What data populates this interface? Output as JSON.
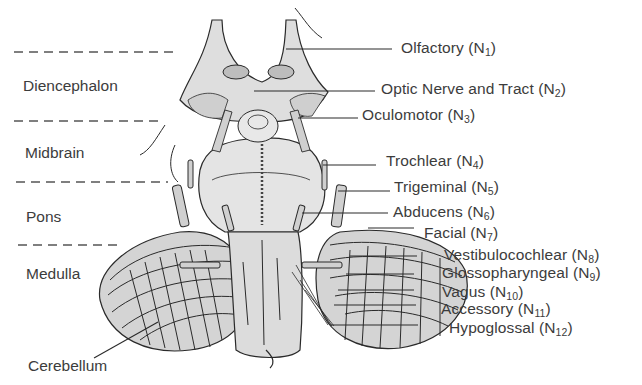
{
  "figure": {
    "regions": [
      {
        "id": "diencephalon",
        "label": "Diencephalon"
      },
      {
        "id": "midbrain",
        "label": "Midbrain"
      },
      {
        "id": "pons",
        "label": "Pons"
      },
      {
        "id": "medulla",
        "label": "Medulla"
      },
      {
        "id": "cerebellum",
        "label": "Cerebellum"
      }
    ],
    "nerves": [
      {
        "id": "olfactory",
        "name": "Olfactory",
        "prefix": " (N",
        "num": "1",
        "suffix": ")"
      },
      {
        "id": "optic",
        "name": "Optic Nerve and Tract",
        "prefix": " (N",
        "num": "2",
        "suffix": ")"
      },
      {
        "id": "oculomotor",
        "name": "Oculomotor",
        "prefix": " (N",
        "num": "3",
        "suffix": ")"
      },
      {
        "id": "trochlear",
        "name": "Trochlear",
        "prefix": " (N",
        "num": "4",
        "suffix": ")"
      },
      {
        "id": "trigeminal",
        "name": "Trigeminal",
        "prefix": " (N",
        "num": "5",
        "suffix": ")"
      },
      {
        "id": "abducens",
        "name": "Abducens",
        "prefix": " (N",
        "num": "6",
        "suffix": ")"
      },
      {
        "id": "facial",
        "name": "Facial",
        "prefix": " (N",
        "num": "7",
        "suffix": ")"
      },
      {
        "id": "vestibulocochlear",
        "name": "Vestibulocochlear",
        "prefix": " (N",
        "num": "8",
        "suffix": ")"
      },
      {
        "id": "glossopharyngeal",
        "name": "Glossopharyngeal",
        "prefix": " (N",
        "num": "9",
        "suffix": ")"
      },
      {
        "id": "vagus",
        "name": "Vagus",
        "prefix": " (N",
        "num": "10",
        "suffix": ")"
      },
      {
        "id": "accessory",
        "name": "Accessory",
        "prefix": " (N",
        "num": "11",
        "suffix": ")"
      },
      {
        "id": "hypoglossal",
        "name": "Hypoglossal",
        "prefix": " (N",
        "num": "12",
        "suffix": ")"
      }
    ],
    "colors": {
      "ink": "#2a2a2a",
      "tissue": "#d6d6d6",
      "tissue_light": "#e4e4e4",
      "label": "#3c3c3c",
      "background": "#ffffff"
    }
  }
}
